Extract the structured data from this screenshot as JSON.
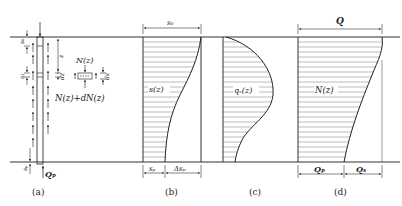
{
  "figure": {
    "panels": [
      {
        "id": "a",
        "caption": "(a)"
      },
      {
        "id": "b",
        "caption": "(b)"
      },
      {
        "id": "c",
        "caption": "(c)"
      },
      {
        "id": "d",
        "caption": "(d)"
      }
    ],
    "panel_a": {
      "labels": {
        "s0": "s₀",
        "s1": "s₁",
        "sp": "sₚ",
        "z": "z",
        "dz": "dz",
        "ds": "ds",
        "Nz": "N(z)",
        "NzdN": "N(z)+dN(z)",
        "Qp": "Qₚ"
      }
    },
    "panel_b": {
      "curve_label": "s(z)",
      "top_dim": "s₀",
      "bottom_dims": [
        "sₚ",
        "Δsₚ"
      ]
    },
    "panel_c": {
      "curve_label": "qₛ(z)"
    },
    "panel_d": {
      "curve_label": "N(z)",
      "top_dim": "Q",
      "bottom_dims": [
        "Qₚ",
        "Qₛ"
      ]
    }
  }
}
